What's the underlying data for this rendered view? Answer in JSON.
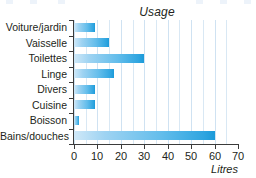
{
  "chart_data": {
    "type": "bar",
    "orientation": "horizontal",
    "title": "Usage",
    "xlabel": "Litres",
    "ylabel": "",
    "categories": [
      "Voiture/jardin",
      "Vaisselle",
      "Toilettes",
      "Linge",
      "Divers",
      "Cuisine",
      "Boisson",
      "Bains/douches"
    ],
    "values": [
      9,
      15,
      30,
      17,
      9,
      9,
      2,
      60
    ],
    "series": [
      {
        "name": "Litres",
        "values": [
          9,
          15,
          30,
          17,
          9,
          9,
          2,
          60
        ]
      }
    ],
    "xlim": [
      0,
      70
    ],
    "xticks": [
      0,
      10,
      20,
      30,
      40,
      50,
      60,
      70
    ],
    "xtick_labels": [
      "0",
      "10",
      "20",
      "30",
      "40",
      "50",
      "60",
      "70"
    ],
    "minor_gridline_step": 5,
    "grid": "vertical",
    "legend": "none",
    "bar_color": "#35A8E0",
    "bar_color_light": "#CFE8F8",
    "gridline_color": "#D9E8F4",
    "axis_color": "#3B3B3B",
    "text_color": "#231F20"
  }
}
